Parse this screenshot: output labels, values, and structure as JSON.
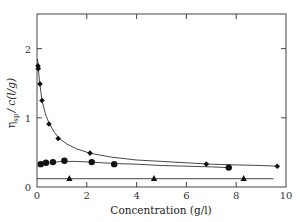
{
  "chart_data": {
    "type": "scatter",
    "title": "",
    "xlabel": "Concentration (g/l)",
    "ylabel": "η_sp / c (l/g)",
    "ylabel_parts": {
      "eta": "η",
      "sub": "sp",
      "rest": "/ c(l/g)"
    },
    "xlim": [
      0,
      10
    ],
    "ylim": [
      0,
      2.5
    ],
    "x_ticks": [
      0,
      2,
      4,
      6,
      8,
      10
    ],
    "y_ticks": [
      0,
      1,
      2
    ],
    "x_tick_labels": [
      "0",
      "2",
      "4",
      "6",
      "8",
      "10"
    ],
    "y_tick_labels": [
      "0",
      "1",
      "2"
    ],
    "grid": false,
    "legend": null,
    "series": [
      {
        "name": "diamonds",
        "marker": "diamond",
        "x": [
          0.04,
          0.05,
          0.12,
          0.2,
          0.48,
          0.85,
          2.13,
          6.8,
          9.65
        ],
        "y": [
          1.75,
          1.71,
          1.49,
          1.25,
          0.91,
          0.7,
          0.49,
          0.33,
          0.3
        ]
      },
      {
        "name": "circles",
        "marker": "circle",
        "x": [
          0.15,
          0.36,
          0.64,
          1.1,
          2.2,
          3.1,
          7.7
        ],
        "y": [
          0.33,
          0.35,
          0.36,
          0.38,
          0.36,
          0.33,
          0.28
        ]
      },
      {
        "name": "triangles",
        "marker": "triangle",
        "x": [
          1.3,
          4.7,
          8.3
        ],
        "y": [
          0.12,
          0.12,
          0.12
        ]
      }
    ],
    "fit_curves": [
      {
        "series": "diamonds",
        "x": [
          0.02,
          0.1,
          0.2,
          0.35,
          0.5,
          0.7,
          0.9,
          1.2,
          1.6,
          2.1,
          3,
          4,
          5,
          6,
          7,
          8,
          9,
          9.7
        ],
        "y": [
          1.85,
          1.52,
          1.25,
          1.04,
          0.91,
          0.79,
          0.7,
          0.62,
          0.55,
          0.49,
          0.43,
          0.39,
          0.37,
          0.35,
          0.33,
          0.32,
          0.31,
          0.3
        ]
      },
      {
        "series": "circles",
        "x": [
          0.1,
          0.5,
          1.0,
          1.5,
          2.2,
          3.1,
          4,
          5,
          6,
          7,
          7.7
        ],
        "y": [
          0.32,
          0.35,
          0.37,
          0.37,
          0.36,
          0.34,
          0.33,
          0.31,
          0.3,
          0.29,
          0.28
        ]
      },
      {
        "series": "triangles",
        "x": [
          0,
          9.5
        ],
        "y": [
          0.12,
          0.12
        ]
      }
    ]
  }
}
